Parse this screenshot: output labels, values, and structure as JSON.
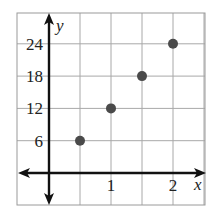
{
  "chart_data": {
    "type": "scatter",
    "title": "",
    "xlabel": "x",
    "ylabel": "y",
    "x_ticks": [
      {
        "value": 1,
        "label": "1"
      },
      {
        "value": 2,
        "label": "2"
      }
    ],
    "y_ticks": [
      {
        "value": 6,
        "label": "6"
      },
      {
        "value": 12,
        "label": "12"
      },
      {
        "value": 18,
        "label": "18"
      },
      {
        "value": 24,
        "label": "24"
      }
    ],
    "xlim": [
      -0.5,
      2.5
    ],
    "ylim": [
      -6,
      30
    ],
    "grid": true,
    "grid_step_x": 0.5,
    "grid_step_y": 6,
    "series": [
      {
        "name": "points",
        "color": "#4a4a4a",
        "points": [
          {
            "x": 0.5,
            "y": 6
          },
          {
            "x": 1,
            "y": 12
          },
          {
            "x": 1.5,
            "y": 18
          },
          {
            "x": 2,
            "y": 24
          }
        ]
      }
    ]
  }
}
